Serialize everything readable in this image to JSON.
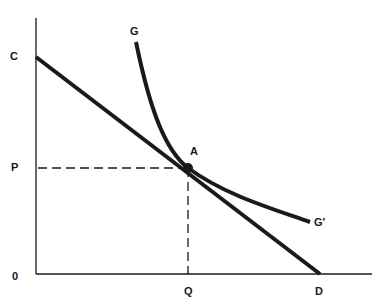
{
  "diagram": {
    "type": "economics-tangency-diagram",
    "labels": {
      "origin": "0",
      "c": "C",
      "p": "P",
      "q": "Q",
      "d": "D",
      "a": "A",
      "g": "G",
      "g_prime": "G′"
    },
    "elements": [
      {
        "id": "budget-line",
        "from": "C",
        "to": "D",
        "style": "solid-thick"
      },
      {
        "id": "indifference-curve",
        "from": "G",
        "to": "G′",
        "style": "solid-thick-convex"
      },
      {
        "id": "tangency-point",
        "label": "A"
      },
      {
        "id": "p-guide",
        "from": "P",
        "to": "A",
        "style": "dashed"
      },
      {
        "id": "q-guide",
        "from": "A",
        "to": "Q",
        "style": "dashed"
      }
    ],
    "colors": {
      "ink": "#1a1a1a",
      "background": "#ffffff"
    }
  }
}
